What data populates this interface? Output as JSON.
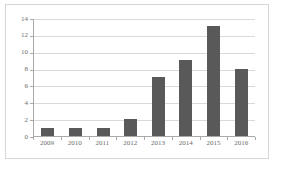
{
  "chart_data": {
    "type": "bar",
    "title": "",
    "xlabel": "",
    "ylabel": "",
    "categories": [
      "2009",
      "2010",
      "2011",
      "2012",
      "2013",
      "2014",
      "2015",
      "2016"
    ],
    "values": [
      1,
      1,
      1,
      2,
      7,
      9,
      13,
      8
    ],
    "ylim": [
      0,
      14
    ],
    "ytick_labels": [
      "0",
      "2",
      "4",
      "6",
      "8",
      "10",
      "12",
      "14"
    ],
    "ytick_values": [
      0,
      2,
      4,
      6,
      8,
      10,
      12,
      14
    ],
    "grid": true,
    "legend": false,
    "legend_position": "none",
    "series": [
      {
        "name": "",
        "values": [
          1,
          1,
          1,
          2,
          7,
          9,
          13,
          8
        ]
      }
    ],
    "colors": {
      "bar": "#595959",
      "gridline": "#d9d9d9",
      "axis": "#a9a9a9",
      "frame": "#d6d6d6",
      "tick_text": "#6b6b6b",
      "background": "#ffffff"
    }
  }
}
